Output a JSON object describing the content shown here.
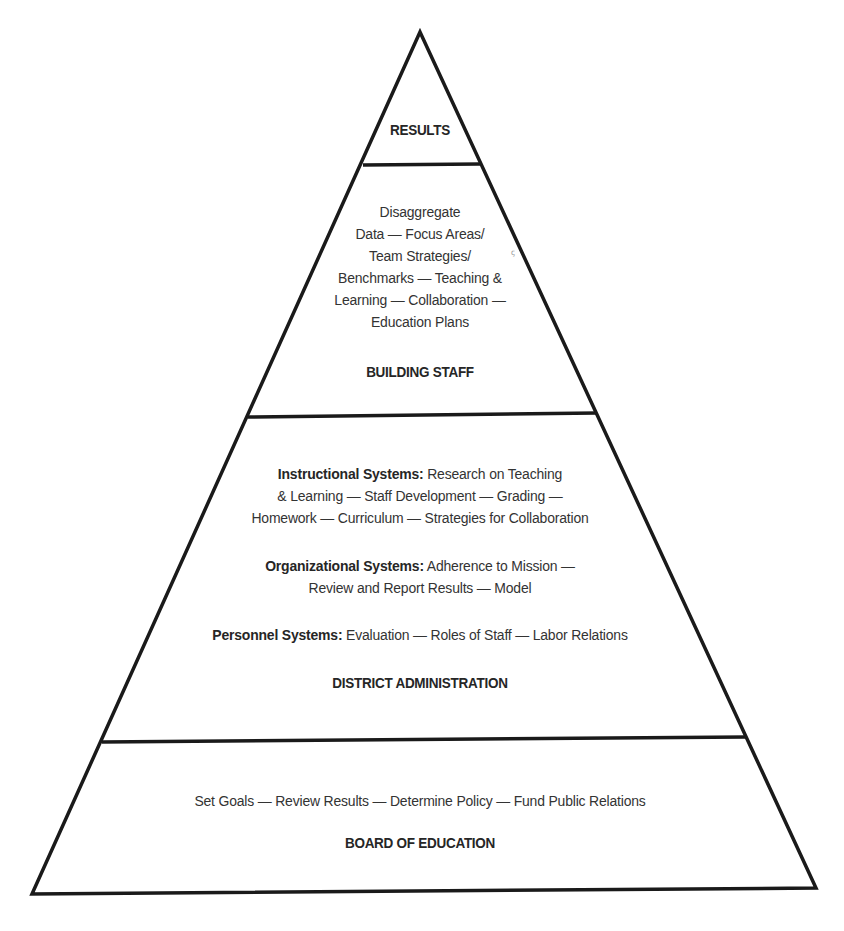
{
  "diagram": {
    "type": "pyramid",
    "tiers_top_to_bottom": [
      {
        "id": "results",
        "label": "RESULTS",
        "items": []
      },
      {
        "id": "building-staff",
        "label": "BUILDING STAFF",
        "lines": [
          "Disaggregate",
          "Data — Focus Areas/",
          "Team Strategies/",
          "Benchmarks — Teaching &",
          "Learning — Collaboration —",
          "Education Plans"
        ]
      },
      {
        "id": "district-administration",
        "label": "DISTRICT ADMINISTRATION",
        "systems": [
          {
            "title": "Instructional Systems:",
            "line1": "Research on Teaching",
            "line2": "& Learning — Staff Development — Grading —",
            "line3": "Homework — Curriculum — Strategies for Collaboration"
          },
          {
            "title": "Organizational Systems:",
            "line1": "Adherence to Mission —",
            "line2": "Review and Report Results — Model"
          },
          {
            "title": "Personnel Systems:",
            "line1": "Evaluation — Roles of Staff — Labor Relations"
          }
        ]
      },
      {
        "id": "board-of-education",
        "label": "BOARD OF EDUCATION",
        "line": "Set Goals — Review Results — Determine Policy — Fund Public Relations"
      }
    ],
    "colors": {
      "stroke": "#1a1a1a",
      "fill": "#ffffff",
      "text": "#333333"
    }
  }
}
